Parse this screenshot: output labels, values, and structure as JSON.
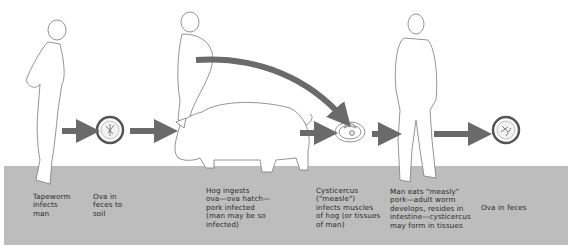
{
  "figure": {
    "colors": {
      "band": "#bdbdbd",
      "arrow": "#6a6a6a",
      "outline": "#7a7a7a",
      "background": "#ffffff",
      "text": "#2a2a2a"
    },
    "stages": [
      {
        "id": "tapeworm-infects-man",
        "label": "Tapeworm\ninfects\nman"
      },
      {
        "id": "ova-feces-soil",
        "label": "Ova in\nfeces to\nsoil"
      },
      {
        "id": "hog-ingests",
        "label": "Hog ingests\nova—ova hatch—\npork infected\n(man may be so\ninfected)"
      },
      {
        "id": "cysticercus",
        "label": "Cysticercus\n(\"measle\")\ninfects muscles\nof hog (or tissues\nof man)"
      },
      {
        "id": "man-eats-measly-pork",
        "label": "Man eats \"measly\"\npork—adult worm\ndevelops, resides in\nintestine—cysticercus\nmay form in tissues"
      },
      {
        "id": "ova-in-feces",
        "label": "Ova in feces"
      }
    ],
    "illustrations": [
      "man-figure-1",
      "ova-egg-1",
      "man-figure-2",
      "pig",
      "cysticercus-cyst",
      "man-figure-3",
      "ova-egg-2"
    ],
    "arrows": [
      "arrow-man-to-ova",
      "arrow-ova-to-pig",
      "arrow-man-to-cyst-curved",
      "arrow-pig-to-cyst",
      "arrow-cyst-to-man",
      "arrow-man-to-ova-final"
    ]
  }
}
